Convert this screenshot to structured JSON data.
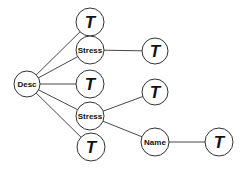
{
  "diagram": {
    "type": "tree",
    "stroke_color": "#333333",
    "fill_color": "#ffffff",
    "nodes": [
      {
        "id": "desc",
        "label": "Desc",
        "kind": "small",
        "x": 27,
        "y": 84,
        "r": 13
      },
      {
        "id": "t1",
        "label": "T",
        "kind": "t",
        "x": 90,
        "y": 22,
        "r": 14
      },
      {
        "id": "stress1",
        "label": "Stress",
        "kind": "small",
        "x": 90,
        "y": 50,
        "r": 14
      },
      {
        "id": "t2",
        "label": "T",
        "kind": "t",
        "x": 90,
        "y": 84,
        "r": 14
      },
      {
        "id": "stress2",
        "label": "Stress",
        "kind": "small",
        "x": 90,
        "y": 116,
        "r": 14
      },
      {
        "id": "t3",
        "label": "T",
        "kind": "t",
        "x": 91,
        "y": 147,
        "r": 14
      },
      {
        "id": "t4",
        "label": "T",
        "kind": "t",
        "x": 155,
        "y": 51,
        "r": 13
      },
      {
        "id": "t5",
        "label": "T",
        "kind": "t",
        "x": 155,
        "y": 92,
        "r": 13
      },
      {
        "id": "name",
        "label": "Name",
        "kind": "small",
        "x": 155,
        "y": 142,
        "r": 14
      },
      {
        "id": "t6",
        "label": "T",
        "kind": "t",
        "x": 219,
        "y": 142,
        "r": 14
      }
    ],
    "edges": [
      {
        "from": "desc",
        "to": "t1"
      },
      {
        "from": "desc",
        "to": "stress1"
      },
      {
        "from": "desc",
        "to": "t2"
      },
      {
        "from": "desc",
        "to": "stress2"
      },
      {
        "from": "desc",
        "to": "t3"
      },
      {
        "from": "stress1",
        "to": "t4"
      },
      {
        "from": "stress2",
        "to": "t5"
      },
      {
        "from": "stress2",
        "to": "name"
      },
      {
        "from": "name",
        "to": "t6"
      }
    ]
  }
}
